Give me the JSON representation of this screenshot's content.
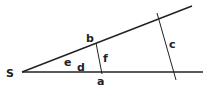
{
  "diagram": {
    "type": "geometry",
    "labels": {
      "vertex": "S",
      "a": "a",
      "b": "b",
      "c": "c",
      "d": "d",
      "e": "e",
      "f": "f"
    },
    "colors": {
      "stroke": "#222222",
      "background": "#ffffff"
    }
  }
}
